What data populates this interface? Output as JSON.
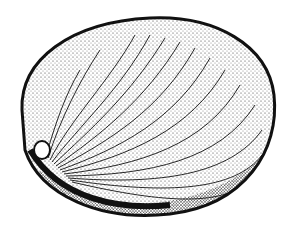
{
  "image": {
    "subject": "shell illustration",
    "style": "stippled pen-and-ink drawing",
    "colors": {
      "background": "#ffffff",
      "ink": "#111111"
    }
  }
}
